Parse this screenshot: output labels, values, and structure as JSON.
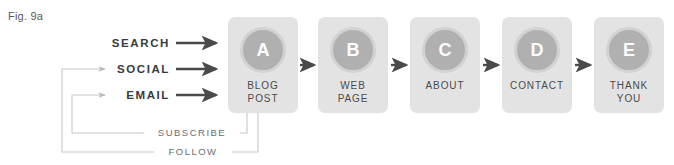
{
  "figure": {
    "label": "Fig. 9a"
  },
  "channels": [
    {
      "id": "search",
      "label": "SEARCH",
      "arrow": "right-arrow-icon"
    },
    {
      "id": "social",
      "label": "SOCIAL",
      "arrow": "right-arrow-icon"
    },
    {
      "id": "email",
      "label": "EMAIL",
      "arrow": "right-arrow-icon"
    }
  ],
  "stages": [
    {
      "badge": "A",
      "line1": "BLOG",
      "line2": "POST"
    },
    {
      "badge": "B",
      "line1": "WEB",
      "line2": "PAGE"
    },
    {
      "badge": "C",
      "line1": "ABOUT",
      "line2": ""
    },
    {
      "badge": "D",
      "line1": "CONTACT",
      "line2": ""
    },
    {
      "badge": "E",
      "line1": "THANK",
      "line2": "YOU"
    }
  ],
  "loops": [
    {
      "id": "subscribe",
      "label": "SUBSCRIBE",
      "from": "BLOG POST",
      "to": "EMAIL"
    },
    {
      "id": "follow",
      "label": "FOLLOW",
      "from": "BLOG POST",
      "to": "SOCIAL"
    }
  ],
  "colors": {
    "card_fill": "#e3e3e3",
    "badge_fill": "#b0b0b0",
    "badge_ring": "#d2d2d2",
    "badge_text": "#ffffff",
    "stage_text": "#4b4b4d",
    "channel_text": "#3a3a3c",
    "loop_text": "#6d6d70",
    "flow_arrow": "#4a4a4c",
    "loop_line": "#c8c8c8",
    "caption_text": "#58585a",
    "background": "#ffffff"
  }
}
